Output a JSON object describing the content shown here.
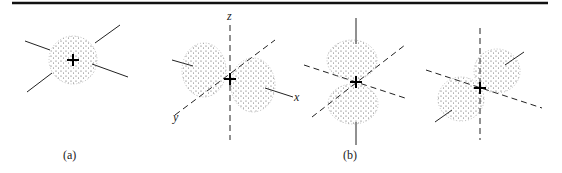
{
  "figure": {
    "panels": [
      {
        "id": "a",
        "caption": "(a)",
        "description": "s orbital: spherical dotted electron cloud centered on nucleus (+)"
      },
      {
        "id": "b",
        "caption": "(b)",
        "description": "p orbitals: dumbbell-shaped lobes along x, z, and y axes",
        "axis_labels": {
          "z": "z",
          "x": "x",
          "y": "y"
        }
      }
    ],
    "nucleus_symbol": "+",
    "colors": {
      "ink": "#222222",
      "rule": "#111111",
      "dots": "#555555"
    }
  }
}
